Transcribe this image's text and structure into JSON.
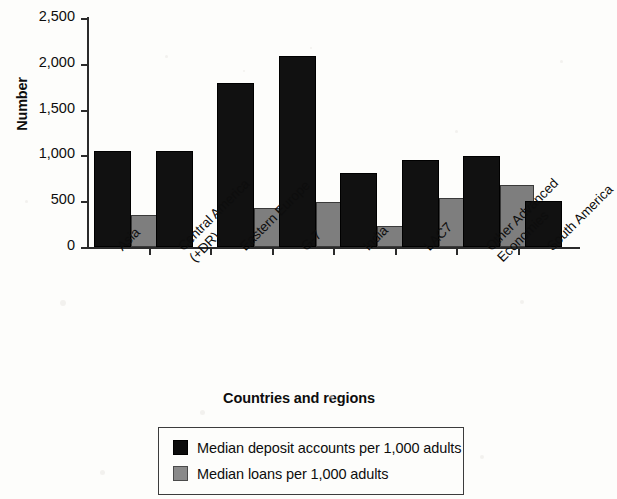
{
  "chart_data": {
    "type": "bar",
    "title": "",
    "xlabel": "Countries and regions",
    "ylabel": "Number",
    "ylim": [
      0,
      2500
    ],
    "ytick_labels": [
      "2,500",
      "2,000",
      "1,500",
      "1,000",
      "500",
      "0"
    ],
    "ytick_values": [
      2500,
      2000,
      1500,
      1000,
      500,
      0
    ],
    "grid": false,
    "legend_position": "bottom",
    "categories": [
      "Asia",
      "Central America (+DR)",
      "Eastern Europe",
      "G-7",
      "India",
      "LAC7",
      "Other Advanced Economies",
      "South America"
    ],
    "category_lines": [
      [
        "Asia"
      ],
      [
        "Central America",
        "(+DR)"
      ],
      [
        "Eastern Europe"
      ],
      [
        "G-7"
      ],
      [
        "India"
      ],
      [
        "LAC7"
      ],
      [
        "Other Advanced",
        "Economies"
      ],
      [
        "South America"
      ]
    ],
    "series": [
      {
        "name": "Median deposit accounts per 1,000 adults",
        "color": "#111111",
        "values": [
          1045,
          1045,
          1790,
          2090,
          810,
          950,
          995,
          505
        ]
      },
      {
        "name": "Median loans per 1,000 adults",
        "color": "#7e7e7e",
        "values": [
          345,
          null,
          425,
          490,
          230,
          535,
          680,
          null
        ]
      }
    ]
  },
  "legend": {
    "items": [
      {
        "label": "Median deposit accounts per 1,000 adults",
        "swatch": "dark"
      },
      {
        "label": "Median loans per 1,000 adults",
        "swatch": "gray"
      }
    ]
  }
}
